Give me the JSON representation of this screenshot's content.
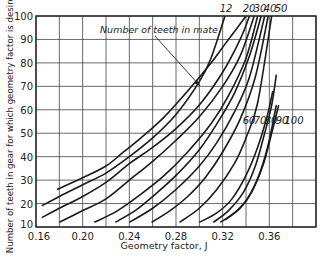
{
  "chart_data": {
    "type": "line",
    "title": "",
    "xlabel": "Geometry factor, J",
    "ylabel": "Number of teeth in gear for which geometry factor is desired",
    "xlim": [
      0.16,
      0.4
    ],
    "ylim": [
      10,
      100
    ],
    "x_ticks": [
      0.16,
      0.2,
      0.24,
      0.28,
      0.32,
      0.36
    ],
    "x_tick_labels": [
      "0.16",
      "0.20",
      "0.24",
      "0.28",
      "0.32",
      "0.36"
    ],
    "x_grid": [
      0.16,
      0.18,
      0.2,
      0.22,
      0.24,
      0.26,
      0.28,
      0.3,
      0.32,
      0.34,
      0.36,
      0.38,
      0.4
    ],
    "y_ticks": [
      10,
      20,
      30,
      40,
      50,
      60,
      70,
      80,
      90,
      100
    ],
    "y_tick_labels": [
      "10",
      "20",
      "30",
      "40",
      "50",
      "60",
      "70",
      "80",
      "90",
      "100"
    ],
    "grid": true,
    "legend_title": "Number of teeth in mate",
    "series": [
      {
        "name": "12",
        "points": [
          [
            0.165,
            19
          ],
          [
            0.18,
            23
          ],
          [
            0.2,
            28
          ],
          [
            0.22,
            33
          ],
          [
            0.24,
            40
          ],
          [
            0.26,
            48
          ],
          [
            0.28,
            58
          ],
          [
            0.3,
            72
          ],
          [
            0.31,
            82
          ],
          [
            0.322,
            100
          ]
        ]
      },
      {
        "name": "20",
        "points": [
          [
            0.178,
            26
          ],
          [
            0.2,
            31
          ],
          [
            0.22,
            36
          ],
          [
            0.235,
            42
          ],
          [
            0.25,
            48
          ],
          [
            0.27,
            57
          ],
          [
            0.29,
            68
          ],
          [
            0.31,
            80
          ],
          [
            0.322,
            88
          ],
          [
            0.34,
            100
          ]
        ]
      },
      {
        "name": "30",
        "points": [
          [
            0.165,
            14
          ],
          [
            0.18,
            18
          ],
          [
            0.2,
            23
          ],
          [
            0.22,
            29
          ],
          [
            0.24,
            37
          ],
          [
            0.26,
            44
          ],
          [
            0.28,
            52
          ],
          [
            0.3,
            62
          ],
          [
            0.32,
            76
          ],
          [
            0.335,
            90
          ],
          [
            0.343,
            100
          ]
        ]
      },
      {
        "name": "40",
        "points": [
          [
            0.18,
            12
          ],
          [
            0.2,
            17
          ],
          [
            0.22,
            22
          ],
          [
            0.24,
            30
          ],
          [
            0.26,
            38
          ],
          [
            0.28,
            47
          ],
          [
            0.3,
            57
          ],
          [
            0.32,
            70
          ],
          [
            0.335,
            83
          ],
          [
            0.347,
            100
          ]
        ]
      },
      {
        "name": "50",
        "points": [
          [
            0.21,
            12
          ],
          [
            0.23,
            17
          ],
          [
            0.25,
            24
          ],
          [
            0.27,
            32
          ],
          [
            0.29,
            42
          ],
          [
            0.31,
            54
          ],
          [
            0.325,
            66
          ],
          [
            0.34,
            82
          ],
          [
            0.35,
            100
          ]
        ]
      },
      {
        "name": "60",
        "points": [
          [
            0.228,
            12
          ],
          [
            0.245,
            17
          ],
          [
            0.26,
            23
          ],
          [
            0.28,
            32
          ],
          [
            0.3,
            43
          ],
          [
            0.315,
            54
          ],
          [
            0.33,
            67
          ],
          [
            0.343,
            83
          ],
          [
            0.353,
            100
          ]
        ]
      },
      {
        "name": "70",
        "points": [
          [
            0.24,
            12
          ],
          [
            0.26,
            18
          ],
          [
            0.28,
            26
          ],
          [
            0.3,
            36
          ],
          [
            0.315,
            46
          ],
          [
            0.33,
            59
          ],
          [
            0.343,
            74
          ],
          [
            0.356,
            100
          ]
        ]
      },
      {
        "name": "80",
        "points": [
          [
            0.259,
            12
          ],
          [
            0.275,
            17
          ],
          [
            0.29,
            23
          ],
          [
            0.305,
            31
          ],
          [
            0.32,
            42
          ],
          [
            0.335,
            56
          ],
          [
            0.348,
            74
          ],
          [
            0.359,
            100
          ]
        ]
      },
      {
        "name": "90",
        "points": [
          [
            0.283,
            12
          ],
          [
            0.3,
            18
          ],
          [
            0.315,
            26
          ],
          [
            0.33,
            37
          ],
          [
            0.34,
            48
          ],
          [
            0.35,
            63
          ],
          [
            0.362,
            100
          ]
        ]
      },
      {
        "name": "100",
        "points": [
          [
            0.312,
            12
          ],
          [
            0.325,
            17
          ],
          [
            0.338,
            25
          ],
          [
            0.348,
            36
          ],
          [
            0.356,
            50
          ],
          [
            0.362,
            62
          ],
          [
            0.366,
            75
          ]
        ]
      }
    ],
    "extra_curves": [
      {
        "name": "14",
        "points": [
          [
            0.3,
            12
          ],
          [
            0.315,
            16
          ],
          [
            0.328,
            22
          ],
          [
            0.34,
            32
          ],
          [
            0.35,
            44
          ],
          [
            0.358,
            57
          ],
          [
            0.363,
            68
          ]
        ]
      },
      {
        "name": "16",
        "points": [
          [
            0.318,
            12
          ],
          [
            0.33,
            16
          ],
          [
            0.341,
            22
          ],
          [
            0.351,
            32
          ],
          [
            0.359,
            45
          ],
          [
            0.366,
            62
          ]
        ]
      },
      {
        "name": "18",
        "points": [
          [
            0.322,
            13
          ],
          [
            0.335,
            18
          ],
          [
            0.345,
            25
          ],
          [
            0.355,
            37
          ],
          [
            0.362,
            50
          ],
          [
            0.368,
            62
          ]
        ]
      }
    ],
    "top_labels": [
      "12",
      "20",
      "30",
      "40",
      "50"
    ],
    "side_labels": [
      "60",
      "70",
      "80",
      "90",
      "100"
    ],
    "annotation": "Number of teeth in mate"
  }
}
